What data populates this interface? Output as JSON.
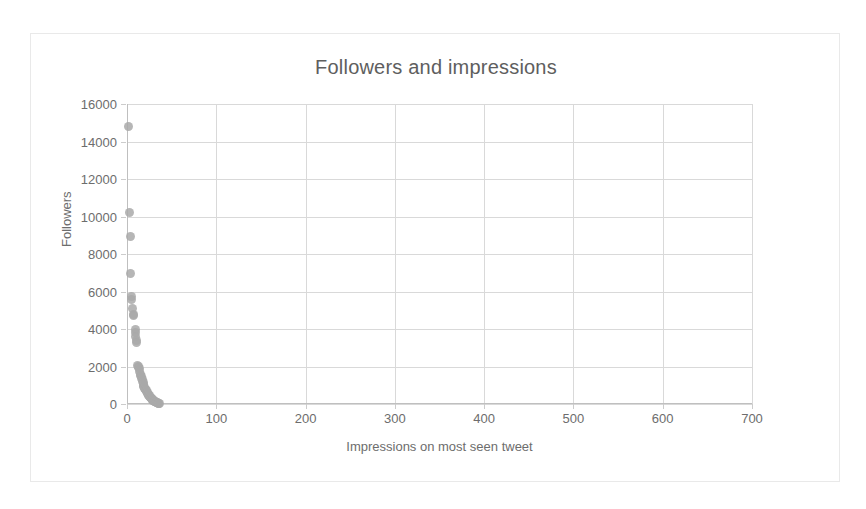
{
  "chart_data": {
    "type": "scatter",
    "title": "Followers and impressions",
    "xlabel": "Impressions on most seen tweet",
    "ylabel": "Followers",
    "xlim": [
      0,
      700
    ],
    "ylim": [
      0,
      16000
    ],
    "xticks": [
      0,
      100,
      200,
      300,
      400,
      500,
      600,
      700
    ],
    "yticks": [
      0,
      2000,
      4000,
      6000,
      8000,
      10000,
      12000,
      14000,
      16000
    ],
    "grid": true,
    "legend": false,
    "marker_color": "#a9a9a9",
    "series": [
      {
        "name": "Accounts",
        "points": [
          [
            2,
            14800
          ],
          [
            3,
            10200
          ],
          [
            4,
            8950
          ],
          [
            4,
            6950
          ],
          [
            5,
            5750
          ],
          [
            5,
            5550
          ],
          [
            6,
            5100
          ],
          [
            7,
            4800
          ],
          [
            7,
            4700
          ],
          [
            9,
            3950
          ],
          [
            9,
            3800
          ],
          [
            10,
            3600
          ],
          [
            11,
            3400
          ],
          [
            11,
            3300
          ],
          [
            12,
            2050
          ],
          [
            13,
            2000
          ],
          [
            13,
            1950
          ],
          [
            14,
            1900
          ],
          [
            14,
            1750
          ],
          [
            15,
            1600
          ],
          [
            15,
            1500
          ],
          [
            16,
            1450
          ],
          [
            16,
            1350
          ],
          [
            17,
            1300
          ],
          [
            17,
            1200
          ],
          [
            18,
            1150
          ],
          [
            18,
            1050
          ],
          [
            19,
            1000
          ],
          [
            19,
            950
          ],
          [
            20,
            900
          ],
          [
            20,
            850
          ],
          [
            21,
            800
          ],
          [
            21,
            750
          ],
          [
            22,
            700
          ],
          [
            22,
            650
          ],
          [
            23,
            600
          ],
          [
            23,
            560
          ],
          [
            24,
            520
          ],
          [
            24,
            480
          ],
          [
            25,
            440
          ],
          [
            25,
            400
          ],
          [
            26,
            370
          ],
          [
            26,
            340
          ],
          [
            27,
            310
          ],
          [
            27,
            280
          ],
          [
            28,
            250
          ],
          [
            29,
            220
          ],
          [
            29,
            195
          ],
          [
            30,
            170
          ],
          [
            31,
            150
          ],
          [
            31,
            130
          ],
          [
            32,
            110
          ],
          [
            33,
            95
          ],
          [
            33,
            80
          ],
          [
            34,
            65
          ],
          [
            35,
            50
          ],
          [
            35,
            35
          ],
          [
            36,
            20
          ]
        ]
      }
    ]
  }
}
